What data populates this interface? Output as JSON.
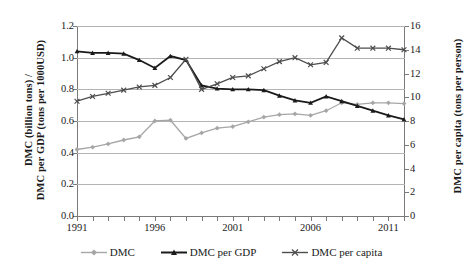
{
  "chart_data": {
    "type": "line",
    "title": "",
    "xlabel": "",
    "ylabel": "DMC (billion tons) / DMC per GDP (tons per 1000USD)",
    "y2label": "DMC per capita (tons per person)",
    "grid": true,
    "legend_position": "bottom",
    "x": [
      1991,
      1992,
      1993,
      1994,
      1995,
      1996,
      1997,
      1998,
      1999,
      2000,
      2001,
      2002,
      2003,
      2004,
      2005,
      2006,
      2007,
      2008,
      2009,
      2010,
      2011,
      2012
    ],
    "xtick_labels": [
      "1991",
      "1996",
      "2001",
      "2006",
      "2011"
    ],
    "xtick_values": [
      1991,
      1996,
      2001,
      2006,
      2011
    ],
    "xlim": [
      1991,
      2012
    ],
    "ylim": [
      0.0,
      1.2
    ],
    "ytick_labels": [
      "0.0",
      "0.2",
      "0.4",
      "0.6",
      "0.8",
      "1.0",
      "1.2"
    ],
    "ytick_values": [
      0.0,
      0.2,
      0.4,
      0.6,
      0.8,
      1.0,
      1.2
    ],
    "y2lim": [
      0,
      16
    ],
    "y2tick_labels": [
      "0",
      "2",
      "4",
      "6",
      "8",
      "10",
      "12",
      "14",
      "16"
    ],
    "y2tick_values": [
      0,
      2,
      4,
      6,
      8,
      10,
      12,
      14,
      16
    ],
    "series": [
      {
        "name": "DMC",
        "axis": "left",
        "color": "#a6a6a6",
        "marker": "diamond",
        "values": [
          0.42,
          0.435,
          0.455,
          0.48,
          0.5,
          0.6,
          0.605,
          0.49,
          0.525,
          0.555,
          0.565,
          0.595,
          0.625,
          0.64,
          0.645,
          0.635,
          0.665,
          0.715,
          0.705,
          0.715,
          0.715,
          0.71
        ]
      },
      {
        "name": "DMC per GDP",
        "axis": "left",
        "color": "#1a1a1a",
        "marker": "triangle",
        "values": [
          1.04,
          1.03,
          1.03,
          1.025,
          0.985,
          0.935,
          1.01,
          0.985,
          0.825,
          0.805,
          0.8,
          0.8,
          0.795,
          0.76,
          0.73,
          0.715,
          0.755,
          0.725,
          0.695,
          0.665,
          0.635,
          0.61
        ]
      },
      {
        "name": "DMC per capita",
        "axis": "right",
        "color": "#4d4d4d",
        "marker": "cross",
        "values_left_scale": [
          0.725,
          0.755,
          0.775,
          0.795,
          0.815,
          0.825,
          0.875,
          0.99,
          0.8,
          0.835,
          0.875,
          0.885,
          0.93,
          0.975,
          1.0,
          0.955,
          0.97,
          1.125,
          1.06,
          1.06,
          1.06,
          1.05
        ],
        "values": [
          9.67,
          10.07,
          10.33,
          10.6,
          10.87,
          11.0,
          11.67,
          13.2,
          10.67,
          11.13,
          11.67,
          11.8,
          12.4,
          13.0,
          13.33,
          12.73,
          12.93,
          15.0,
          14.13,
          14.13,
          14.13,
          14.0
        ]
      }
    ],
    "legend": [
      {
        "label": "DMC",
        "color": "#a6a6a6",
        "marker": "diamond"
      },
      {
        "label": "DMC per GDP",
        "color": "#1a1a1a",
        "marker": "triangle"
      },
      {
        "label": "DMC per capita",
        "color": "#4d4d4d",
        "marker": "cross"
      }
    ]
  }
}
